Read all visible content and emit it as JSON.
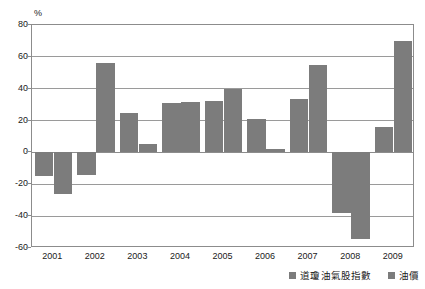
{
  "chart_data": {
    "type": "bar",
    "title": "",
    "xlabel": "",
    "ylabel": "%",
    "unit_label": "%",
    "categories": [
      "2001",
      "2002",
      "2003",
      "2004",
      "2005",
      "2006",
      "2007",
      "2008",
      "2009"
    ],
    "series": [
      {
        "name": "道瓊油氣股指數",
        "color": "#7c7c7c",
        "values": [
          -14.5,
          -14.0,
          25.0,
          31.0,
          32.5,
          21.0,
          33.5,
          -38.0,
          16.0
        ]
      },
      {
        "name": "油價",
        "color": "#7c7c7c",
        "values": [
          -26.0,
          56.0,
          5.5,
          31.5,
          40.0,
          2.0,
          55.0,
          -54.5,
          70.0
        ]
      }
    ],
    "ylim": [
      -60,
      80
    ],
    "yticks": [
      80,
      60,
      40,
      20,
      0,
      -20,
      -40,
      -60
    ],
    "ytick_labels": [
      "80",
      "60",
      "40",
      "20",
      "0",
      "-20",
      "-40",
      "-60"
    ],
    "grid": true,
    "legend_position": "bottom-right"
  },
  "legend": {
    "entries": [
      {
        "label": "道瓊油氣股指數",
        "color": "#7c7c7c"
      },
      {
        "label": "油價",
        "color": "#7c7c7c"
      }
    ]
  },
  "colors": {
    "bar": "#7c7c7c",
    "grid": "#9a9a9a",
    "axis": "#8c8c8c",
    "text": "#1a1a1a",
    "background": "#ffffff"
  }
}
